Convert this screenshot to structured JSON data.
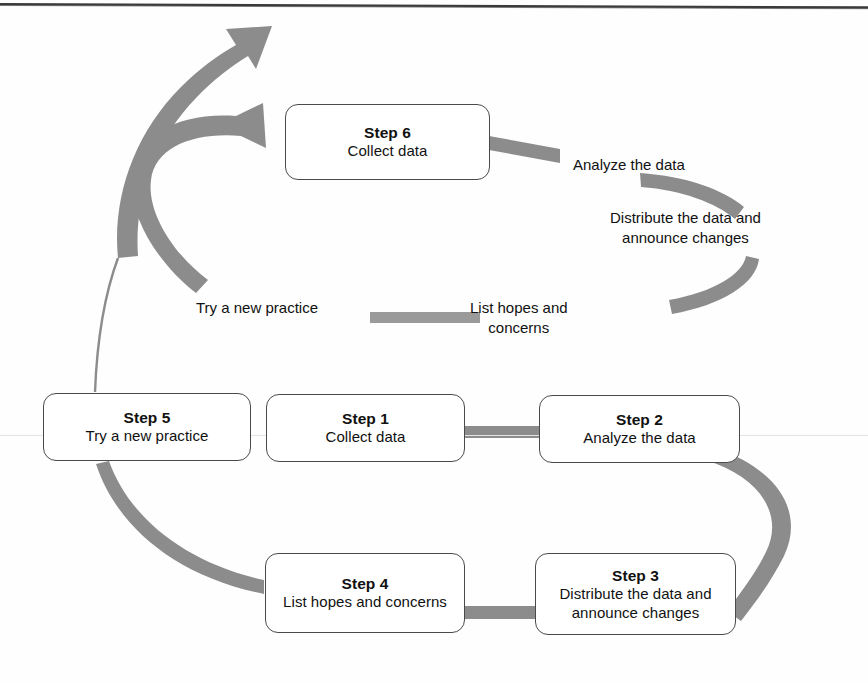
{
  "diagram": {
    "colors": {
      "ribbon": "#8a8a8a",
      "box_border": "#4a4a4a",
      "text": "#111111",
      "background": "#ffffff"
    },
    "nodes": [
      {
        "id": "step1",
        "title": "Step 1",
        "subtitle": "Collect data"
      },
      {
        "id": "step2",
        "title": "Step 2",
        "subtitle": "Analyze the data"
      },
      {
        "id": "step3",
        "title": "Step 3",
        "subtitle": "Distribute the data and\nannounce changes"
      },
      {
        "id": "step4",
        "title": "Step 4",
        "subtitle": "List hopes and\nconcerns"
      },
      {
        "id": "step5",
        "title": "Step 5",
        "subtitle": "Try a new practice"
      },
      {
        "id": "step6",
        "title": "Step 6",
        "subtitle": "Collect data"
      }
    ],
    "arc_labels": [
      {
        "id": "analyze",
        "text": "Analyze the data"
      },
      {
        "id": "distribute",
        "text": "Distribute the data and\nannounce changes"
      },
      {
        "id": "try",
        "text": "Try a new practice"
      },
      {
        "id": "list",
        "text": "List hopes and\nconcerns"
      }
    ],
    "connectors": [
      {
        "id": "step1-to-step2",
        "kind": "straight-bar"
      },
      {
        "id": "step2-to-step3",
        "kind": "s-curve"
      },
      {
        "id": "step4-to-step3",
        "kind": "straight-bar"
      },
      {
        "id": "step5-to-step4",
        "kind": "curve"
      },
      {
        "id": "step6-to-analyze",
        "kind": "straight-bar"
      },
      {
        "id": "cycle-arrow-to-step6",
        "kind": "curved-arrow"
      },
      {
        "id": "cycle-arrow-outward",
        "kind": "curved-arrow"
      },
      {
        "id": "upper-arc-right",
        "kind": "arc"
      },
      {
        "id": "upper-arc-bottom",
        "kind": "arc"
      },
      {
        "id": "upper-arc-left",
        "kind": "arc"
      }
    ]
  }
}
